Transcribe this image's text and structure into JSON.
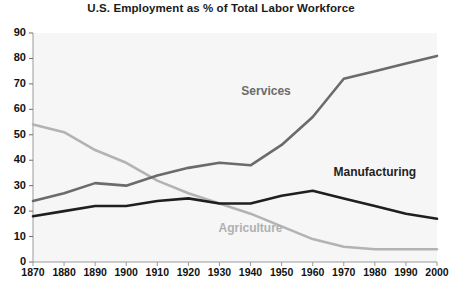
{
  "chart_data": {
    "type": "line",
    "title": "U.S. Employment as % of Total Labor Workforce",
    "xlabel": "",
    "ylabel": "",
    "x": [
      1870,
      1880,
      1890,
      1900,
      1910,
      1920,
      1930,
      1940,
      1950,
      1960,
      1970,
      1980,
      1990,
      2000
    ],
    "xtick_labels": [
      "1870",
      "1880",
      "1890",
      "1900",
      "1910",
      "1920",
      "1930",
      "1940",
      "1950",
      "1960",
      "1970",
      "1980",
      "1990",
      "2000"
    ],
    "ytick_labels": [
      "0",
      "10",
      "20",
      "30",
      "40",
      "50",
      "60",
      "70",
      "80",
      "90"
    ],
    "ylim": [
      0,
      90
    ],
    "xlim": [
      1870,
      2000
    ],
    "ytick_step": 10,
    "grid": false,
    "legend_position": "inline-annotations",
    "series": [
      {
        "name": "Agriculture",
        "color": "#b3b3b3",
        "values": [
          54,
          51,
          44,
          39,
          32,
          27,
          23,
          19,
          14,
          9,
          6,
          5,
          5,
          5
        ],
        "label_x": 1940,
        "label_y": 13
      },
      {
        "name": "Services",
        "color": "#6b6b6b",
        "values": [
          24,
          27,
          31,
          30,
          34,
          37,
          39,
          38,
          46,
          57,
          72,
          75,
          78,
          81
        ],
        "label_x": 1945,
        "label_y": 67
      },
      {
        "name": "Manufacturing",
        "color": "#1f1f1f",
        "values": [
          18,
          20,
          22,
          22,
          24,
          25,
          23,
          23,
          26,
          28,
          25,
          22,
          19,
          17
        ],
        "label_x": 1980,
        "label_y": 35
      }
    ]
  }
}
